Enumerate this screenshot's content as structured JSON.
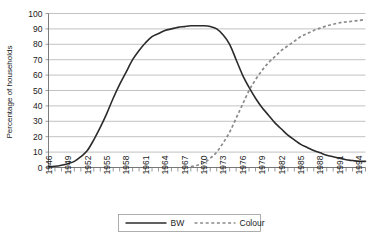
{
  "chart_data": {
    "type": "line",
    "title": "",
    "xlabel": "",
    "ylabel": "Percentage of households",
    "ylim": [
      0,
      100
    ],
    "xlim": [
      1946,
      1995
    ],
    "grid": true,
    "legend_position": "bottom-center",
    "y_ticks": [
      "0",
      "10",
      "20",
      "30",
      "40",
      "50",
      "60",
      "70",
      "80",
      "90",
      "100"
    ],
    "x_ticks": [
      "1946",
      "1949",
      "1952",
      "1955",
      "1958",
      "1961",
      "1964",
      "1967",
      "1970",
      "1973",
      "1976",
      "1979",
      "1982",
      "1985",
      "1988",
      "1991",
      "1994"
    ],
    "x_all_years": [
      1946,
      1947,
      1948,
      1949,
      1950,
      1951,
      1952,
      1953,
      1954,
      1955,
      1956,
      1957,
      1958,
      1959,
      1960,
      1961,
      1962,
      1963,
      1964,
      1965,
      1966,
      1967,
      1968,
      1969,
      1970,
      1971,
      1972,
      1973,
      1974,
      1975,
      1976,
      1977,
      1978,
      1979,
      1980,
      1981,
      1982,
      1983,
      1984,
      1985,
      1986,
      1987,
      1988,
      1989,
      1990,
      1991,
      1992,
      1993,
      1994,
      1995
    ],
    "series": [
      {
        "name": "BW",
        "style": "solid",
        "color": "#2b2b2b",
        "values": [
          0.5,
          0.8,
          1.5,
          2.5,
          4,
          7,
          11,
          18,
          26,
          35,
          45,
          54,
          62,
          70,
          76,
          81,
          85,
          87,
          89,
          90,
          91,
          91.5,
          92,
          92,
          92,
          91.5,
          90,
          86,
          80,
          70,
          60,
          52,
          45,
          39,
          34,
          29,
          25,
          21,
          18,
          15,
          13,
          11,
          9.5,
          8,
          7,
          6,
          5,
          4.5,
          4,
          4
        ]
      },
      {
        "name": "Colour",
        "style": "dashed",
        "color": "#8a8a8a",
        "values": [
          null,
          null,
          null,
          null,
          null,
          null,
          null,
          null,
          null,
          null,
          null,
          null,
          null,
          null,
          null,
          null,
          null,
          null,
          null,
          null,
          null,
          null,
          0.5,
          1.5,
          3,
          6,
          10,
          16,
          23,
          32,
          41,
          50,
          57,
          63,
          68,
          72,
          76,
          79,
          82,
          85,
          87,
          89,
          90.5,
          92,
          93,
          94,
          94.5,
          95,
          95.5,
          96
        ]
      }
    ]
  },
  "legend": {
    "items": [
      {
        "label": "BW",
        "style": "solid"
      },
      {
        "label": "Colour",
        "style": "dashed"
      }
    ]
  },
  "colors": {
    "bw_line": "#2b2b2b",
    "colour_line": "#8a8a8a",
    "gridline": "#a8a8a8",
    "axis": "#6e6e6e",
    "text": "#1a1a1a",
    "background": "#ffffff"
  }
}
